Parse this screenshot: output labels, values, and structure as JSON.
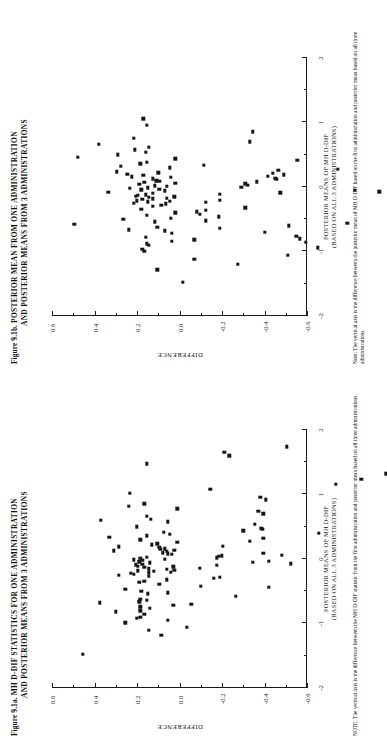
{
  "page": {
    "width": 387,
    "height": 744,
    "orientation": "rotated-90-ccw",
    "background": "#ffffff",
    "ink_color": "#15151a"
  },
  "figures": [
    {
      "id": "figure-a",
      "number": "Figure 9.1a.",
      "title_line1": "MH D-DIF STATISTICS FOR ONE ADMINISTRATION",
      "title_line2": "AND POSTERIOR MEANS FROM 3 ADMINISTRATIONS",
      "note_lead": "NOTE:",
      "note_text": "The vertical axis is the difference between the MH D-DIF statistic from the first administration and posterior mean based on all three administrations.",
      "chart_data": {
        "type": "scatter",
        "title": "MH D-DIF STATISTICS FOR ONE ADMINISTRATION AND POSTERIOR MEANS FROM 3 ADMINISTRATIONS",
        "xlabel": "POSTERIOR MEANS OF MH D-DIF (BASED ON ALL 3 ADMINISTRATIONS)",
        "xlabel_line1": "POSTERIOR MEANS OF MH D-DIF",
        "xlabel_line2": "(BASED ON ALL 3 ADMINISTRATIONS)",
        "ylabel": "DIFFERENCE",
        "xlim": [
          -2,
          2
        ],
        "ylim": [
          -0.6,
          0.6
        ],
        "xticks": [
          -2,
          -1,
          0,
          1,
          2
        ],
        "xticklabels": [
          "-2",
          "-1",
          "0",
          "1",
          "2"
        ],
        "xminorticks": [
          -1.5,
          -0.5,
          0.5,
          1.5
        ],
        "yticks": [
          -0.6,
          -0.4,
          -0.2,
          0.0,
          0.2,
          0.4,
          0.6
        ],
        "yticklabels": [
          "-0.6",
          "-0.4",
          "-0.2",
          "0.0",
          "0.2",
          "0.4",
          "0.6"
        ],
        "yminorticks": [
          -0.5,
          -0.3,
          -0.1,
          0.1,
          0.3,
          0.5
        ],
        "grid": false,
        "legend": false,
        "marker": "filled-square",
        "marker_color": "#15151a",
        "n_points": 110,
        "points": [
          [
            -1.48,
            0.455
          ],
          [
            -1.18,
            0.085
          ],
          [
            -1.1,
            0.145
          ],
          [
            -1.06,
            -0.035
          ],
          [
            -0.99,
            0.255
          ],
          [
            -0.95,
            0.055
          ],
          [
            -0.92,
            0.2
          ],
          [
            -0.9,
            0.185
          ],
          [
            -0.86,
            0.165
          ],
          [
            -0.82,
            0.3
          ],
          [
            -0.8,
            0.185
          ],
          [
            -0.76,
            0.14
          ],
          [
            -0.74,
            0.185
          ],
          [
            -0.72,
            0.03
          ],
          [
            -0.7,
            -0.055
          ],
          [
            -0.68,
            0.375
          ],
          [
            -0.66,
            0.19
          ],
          [
            -0.64,
            0.155
          ],
          [
            -0.62,
            0.185
          ],
          [
            -0.58,
            -0.265
          ],
          [
            -0.54,
            0.15
          ],
          [
            -0.52,
            0.055
          ],
          [
            -0.5,
            0.18
          ],
          [
            -0.47,
            0.255
          ],
          [
            -0.44,
            -0.42
          ],
          [
            -0.42,
            -0.1
          ],
          [
            -0.39,
            0.095
          ],
          [
            -0.36,
            0.19
          ],
          [
            -0.34,
            0.165
          ],
          [
            -0.32,
            0.06
          ],
          [
            -0.3,
            -0.16
          ],
          [
            -0.28,
            -0.19
          ],
          [
            -0.27,
            0.145
          ],
          [
            -0.25,
            0.285
          ],
          [
            -0.24,
            0.215
          ],
          [
            -0.22,
            0.23
          ],
          [
            -0.21,
            0.145
          ],
          [
            -0.2,
            0.04
          ],
          [
            -0.19,
            0.12
          ],
          [
            -0.18,
            0.195
          ],
          [
            -0.17,
            0.025
          ],
          [
            -0.16,
            0.06
          ],
          [
            -0.15,
            0.145
          ],
          [
            -0.14,
            -0.095
          ],
          [
            -0.13,
            0.165
          ],
          [
            -0.12,
            0.03
          ],
          [
            -0.11,
            0.195
          ],
          [
            -0.1,
            -0.175
          ],
          [
            -0.09,
            0.205
          ],
          [
            -0.08,
            0.175
          ],
          [
            -0.07,
            -0.525
          ],
          [
            -0.06,
            0.14
          ],
          [
            -0.05,
            -0.345
          ],
          [
            -0.04,
            0.19
          ],
          [
            -0.03,
            -0.42
          ],
          [
            -0.02,
            0.175
          ],
          [
            -0.01,
            0.215
          ],
          [
            0.0,
            0.07
          ],
          [
            0.01,
            0.185
          ],
          [
            0.02,
            -0.175
          ],
          [
            0.03,
            0.155
          ],
          [
            0.04,
            -0.185
          ],
          [
            0.05,
            -0.2
          ],
          [
            0.06,
            -0.48
          ],
          [
            0.07,
            0.035
          ],
          [
            0.08,
            0.055
          ],
          [
            0.09,
            -0.395
          ],
          [
            0.1,
            0.08
          ],
          [
            0.12,
            0.06
          ],
          [
            0.13,
            0.31
          ],
          [
            0.14,
            0.025
          ],
          [
            0.15,
            0.09
          ],
          [
            0.16,
            0.07
          ],
          [
            0.18,
            0.095
          ],
          [
            0.19,
            0.285
          ],
          [
            0.2,
            -0.205
          ],
          [
            0.22,
            0.13
          ],
          [
            0.24,
            0.105
          ],
          [
            0.26,
            0.01
          ],
          [
            0.28,
            -0.33
          ],
          [
            0.3,
            0.185
          ],
          [
            0.32,
            -0.395
          ],
          [
            0.34,
            0.33
          ],
          [
            0.36,
            0.155
          ],
          [
            0.38,
            0.045
          ],
          [
            0.4,
            -0.655
          ],
          [
            0.42,
            0.075
          ],
          [
            0.44,
            -0.3
          ],
          [
            0.46,
            -0.39
          ],
          [
            0.48,
            -0.385
          ],
          [
            0.5,
            0.2
          ],
          [
            0.54,
            -0.355
          ],
          [
            0.58,
            0.055
          ],
          [
            0.6,
            0.37
          ],
          [
            0.62,
            0.135
          ],
          [
            0.66,
            0.155
          ],
          [
            0.7,
            -0.395
          ],
          [
            0.74,
            -0.37
          ],
          [
            0.78,
            0.01
          ],
          [
            0.82,
            0.24
          ],
          [
            0.86,
            0.165
          ],
          [
            0.92,
            -0.405
          ],
          [
            0.96,
            -0.38
          ],
          [
            1.02,
            0.235
          ],
          [
            1.08,
            -0.145
          ],
          [
            1.16,
            -0.735
          ],
          [
            1.24,
            -0.855
          ],
          [
            1.32,
            -0.97
          ],
          [
            1.48,
            0.155
          ],
          [
            1.6,
            -0.235
          ],
          [
            1.66,
            -0.21
          ],
          [
            1.74,
            -0.505
          ]
        ]
      }
    },
    {
      "id": "figure-b",
      "number": "Figure 9.1b.",
      "title_line1": "POSTERIOR MEAN FROM ONE ADMINISTRATION",
      "title_line2": "AND POSTERIOR MEANS FROM 3 ADMINISTRATIONS",
      "note_lead": "Note:",
      "note_text": "The vertical axis is the difference between the  posterior mean of MH D-DIF based on the first administration and posterior mean based on all three administrations.",
      "chart_data": {
        "type": "scatter",
        "title": "POSTERIOR MEAN FROM ONE ADMINISTRATION AND POSTERIOR MEANS FROM 3 ADMINISTRATIONS",
        "xlabel": "POSTERIOR MEANS OF MH D-DIF (BASED ON ALL 3 ADMINISTRATIONS)",
        "xlabel_line1": "POSTERIOR MEANS OF MH D-DIF",
        "xlabel_line2": "(BASED ON ALL 3 ADMINISTRATIONS)",
        "ylabel": "DIFFERENCE",
        "xlim": [
          -2,
          2
        ],
        "ylim": [
          -0.6,
          0.6
        ],
        "xticks": [
          -2,
          -1,
          0,
          1,
          2
        ],
        "xticklabels": [
          "-2",
          "-1",
          "0",
          "1",
          "2"
        ],
        "xminorticks": [
          -1.5,
          -0.5,
          0.5,
          1.5
        ],
        "yticks": [
          -0.6,
          -0.4,
          -0.2,
          0.0,
          0.2,
          0.4,
          0.6
        ],
        "yticklabels": [
          "-0.6",
          "-0.4",
          "-0.2",
          "0.0",
          "0.2",
          "0.4",
          "0.6"
        ],
        "yminorticks": [
          -0.5,
          -0.3,
          -0.1,
          0.1,
          0.3,
          0.5
        ],
        "grid": false,
        "legend": false,
        "marker": "filled-square",
        "marker_color": "#15151a",
        "n_points": 108,
        "points": [
          [
            -1.48,
            -0.015
          ],
          [
            -1.28,
            0.105
          ],
          [
            -1.2,
            -0.275
          ],
          [
            -1.12,
            -0.07
          ],
          [
            -1.06,
            -0.51
          ],
          [
            -1.0,
            0.165
          ],
          [
            -0.96,
            0.175
          ],
          [
            -0.94,
            -0.65
          ],
          [
            -0.9,
            0.145
          ],
          [
            -0.88,
            0.155
          ],
          [
            -0.86,
            -0.595
          ],
          [
            -0.84,
            0.035
          ],
          [
            -0.82,
            -0.07
          ],
          [
            -0.8,
            -0.565
          ],
          [
            -0.78,
            0.16
          ],
          [
            -0.76,
            -0.55
          ],
          [
            -0.72,
            0.035
          ],
          [
            -0.7,
            -0.4
          ],
          [
            -0.68,
            0.07
          ],
          [
            -0.66,
            0.24
          ],
          [
            -0.64,
            -0.19
          ],
          [
            -0.62,
            0.105
          ],
          [
            -0.6,
            -0.515
          ],
          [
            -0.58,
            0.495
          ],
          [
            -0.56,
            -0.79
          ],
          [
            -0.54,
            0.115
          ],
          [
            -0.52,
            -0.125
          ],
          [
            -0.5,
            0.265
          ],
          [
            -0.48,
            0.04
          ],
          [
            -0.46,
            -0.185
          ],
          [
            -0.44,
            0.155
          ],
          [
            -0.42,
            -0.095
          ],
          [
            -0.4,
            0.02
          ],
          [
            -0.38,
            -0.08
          ],
          [
            -0.36,
            -0.125
          ],
          [
            -0.34,
            0.18
          ],
          [
            -0.32,
            -0.31
          ],
          [
            -0.3,
            0.125
          ],
          [
            -0.28,
            0.085
          ],
          [
            -0.26,
            0.065
          ],
          [
            -0.25,
            0.215
          ],
          [
            -0.24,
            -0.125
          ],
          [
            -0.23,
            0.15
          ],
          [
            -0.22,
            0.045
          ],
          [
            -0.21,
            0.2
          ],
          [
            -0.2,
            -0.19
          ],
          [
            -0.19,
            0.175
          ],
          [
            -0.18,
            0.125
          ],
          [
            -0.17,
            0.06
          ],
          [
            -0.16,
            0.145
          ],
          [
            -0.15,
            0.025
          ],
          [
            -0.14,
            0.205
          ],
          [
            -0.13,
            0.195
          ],
          [
            -0.12,
            0.16
          ],
          [
            -0.11,
            -0.19
          ],
          [
            -0.1,
            0.125
          ],
          [
            -0.09,
            -0.475
          ],
          [
            -0.08,
            0.335
          ],
          [
            -0.07,
            -0.94
          ],
          [
            -0.06,
            0.07
          ],
          [
            -0.05,
            -0.825
          ],
          [
            -0.04,
            0.18
          ],
          [
            -0.03,
            0.095
          ],
          [
            -0.02,
            0.235
          ],
          [
            -0.01,
            0.15
          ],
          [
            0.0,
            -0.29
          ],
          [
            0.01,
            0.06
          ],
          [
            0.02,
            0.115
          ],
          [
            0.03,
            -0.32
          ],
          [
            0.04,
            0.19
          ],
          [
            0.05,
            -0.31
          ],
          [
            0.06,
            0.02
          ],
          [
            0.07,
            0.165
          ],
          [
            0.08,
            -0.365
          ],
          [
            0.09,
            0.095
          ],
          [
            0.1,
            0.11
          ],
          [
            0.12,
            -0.455
          ],
          [
            0.13,
            0.125
          ],
          [
            0.14,
            -0.45
          ],
          [
            0.15,
            0.04
          ],
          [
            0.16,
            0.225
          ],
          [
            0.17,
            -0.415
          ],
          [
            0.18,
            0.17
          ],
          [
            0.19,
            -0.49
          ],
          [
            0.2,
            0.245
          ],
          [
            0.21,
            -0.44
          ],
          [
            0.22,
            0.1
          ],
          [
            0.24,
            0.295
          ],
          [
            0.26,
            -0.465
          ],
          [
            0.28,
            -0.745
          ],
          [
            0.3,
            0.045
          ],
          [
            0.32,
            0.275
          ],
          [
            0.34,
            -0.115
          ],
          [
            0.36,
            0.185
          ],
          [
            0.38,
            0.155
          ],
          [
            0.42,
            -0.555
          ],
          [
            0.44,
            0.02
          ],
          [
            0.46,
            0.48
          ],
          [
            0.5,
            0.29
          ],
          [
            0.54,
            0.16
          ],
          [
            0.58,
            0.21
          ],
          [
            0.62,
            0.145
          ],
          [
            0.66,
            0.38
          ],
          [
            0.7,
            -0.33
          ],
          [
            0.76,
            0.215
          ],
          [
            0.86,
            -0.345
          ],
          [
            0.96,
            0.155
          ],
          [
            1.06,
            0.17
          ]
        ]
      }
    }
  ]
}
